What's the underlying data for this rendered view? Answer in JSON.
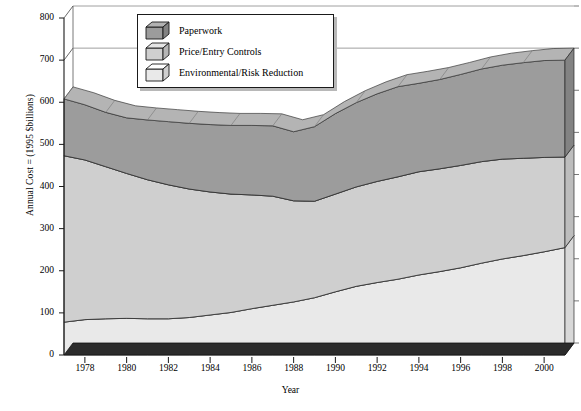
{
  "chart_data": {
    "type": "area",
    "title": "",
    "subtitle": "",
    "xlabel": "Year",
    "ylabel": "Annual Cost = (1995 $billions)",
    "stacked": true,
    "grid": false,
    "legend_position": "top-left-inside",
    "xlim": [
      1977,
      2001
    ],
    "ylim": [
      0,
      800
    ],
    "ytick_step": 100,
    "yticks": [
      "0",
      "100",
      "200",
      "300",
      "400",
      "500",
      "600",
      "700",
      "800"
    ],
    "xticks": [
      "1978",
      "1980",
      "1982",
      "1984",
      "1986",
      "1988",
      "1990",
      "1992",
      "1994",
      "1996",
      "1998",
      "2000"
    ],
    "x": [
      1977,
      1978,
      1979,
      1980,
      1981,
      1982,
      1983,
      1984,
      1985,
      1986,
      1987,
      1988,
      1989,
      1990,
      1991,
      1992,
      1993,
      1994,
      1995,
      1996,
      1997,
      1998,
      1999,
      2000,
      2001
    ],
    "series": [
      {
        "name": "Environmental/Risk Reduction",
        "color": "#e9e9e9",
        "top_color": "#f2f2f2",
        "side_color": "#d8d8d8",
        "values": [
          78,
          84,
          86,
          87,
          86,
          86,
          89,
          95,
          101,
          110,
          118,
          126,
          136,
          150,
          163,
          172,
          180,
          190,
          198,
          207,
          218,
          228,
          236,
          245,
          255
        ]
      },
      {
        "name": "Price/Entry Controls",
        "color": "#cfcfcf",
        "top_color": "#dcdcdc",
        "side_color": "#bdbdbd",
        "values": [
          395,
          379,
          361,
          344,
          330,
          318,
          305,
          292,
          281,
          270,
          259,
          240,
          229,
          232,
          236,
          240,
          243,
          245,
          244,
          243,
          241,
          237,
          231,
          224,
          215
        ]
      },
      {
        "name": "Paperwork",
        "color": "#9c9c9c",
        "top_color": "#b4b4b4",
        "side_color": "#838383",
        "values": [
          135,
          131,
          129,
          132,
          142,
          150,
          156,
          160,
          163,
          165,
          167,
          164,
          177,
          191,
          200,
          208,
          214,
          210,
          212,
          216,
          220,
          223,
          227,
          230,
          230
        ]
      }
    ],
    "cumulative_top": [
      608,
      594,
      576,
      563,
      558,
      554,
      550,
      547,
      545,
      545,
      544,
      530,
      542,
      573,
      599,
      620,
      637,
      645,
      654,
      666,
      679,
      688,
      694,
      699,
      700
    ]
  },
  "legend": {
    "items": [
      {
        "label": "Paperwork",
        "icon": "cube-icon",
        "color": "#9c9c9c"
      },
      {
        "label": "Price/Entry Controls",
        "icon": "cube-icon",
        "color": "#cfcfcf"
      },
      {
        "label": "Environmental/Risk Reduction",
        "icon": "cube-icon",
        "color": "#e9e9e9"
      }
    ]
  }
}
